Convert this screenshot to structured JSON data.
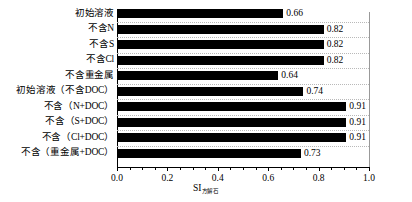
{
  "chart_data": {
    "type": "bar",
    "orientation": "horizontal",
    "title": "",
    "xlabel": "SI",
    "xlabel_subscript": "方解石",
    "ylabel": "",
    "xlim": [
      0.0,
      1.0
    ],
    "grid": "dotted-row-separators",
    "legend": "none",
    "bar_color": "#000000",
    "categories": [
      "初始溶液",
      "不含N",
      "不含S",
      "不含Cl",
      "不含重金属",
      "初始溶液（不含DOC）",
      "不含（N+DOC）",
      "不含（S+DOC）",
      "不含（Cl+DOC）",
      "不含（重金属+DOC）"
    ],
    "values": [
      0.66,
      0.82,
      0.82,
      0.82,
      0.64,
      0.74,
      0.91,
      0.91,
      0.91,
      0.73
    ],
    "value_labels": [
      "0.66",
      "0.82",
      "0.82",
      "0.82",
      "0.64",
      "0.74",
      "0.91",
      "0.91",
      "0.91",
      "0.73"
    ],
    "xticks": [
      0.0,
      0.2,
      0.4,
      0.6,
      0.8,
      1.0
    ],
    "xtick_labels": [
      "0.0",
      "0.2",
      "0.4",
      "0.6",
      "0.8",
      "1.0"
    ]
  }
}
